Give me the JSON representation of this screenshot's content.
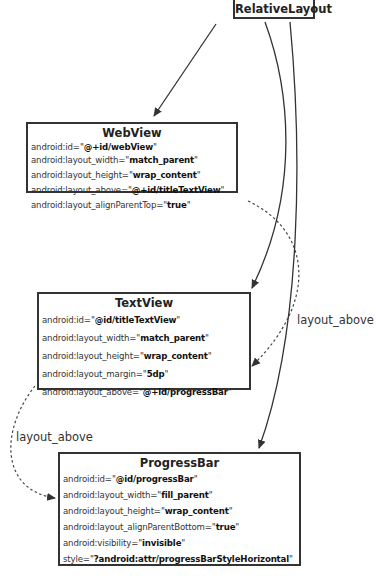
{
  "root": {
    "title": "RelativeLayout"
  },
  "nodes": [
    {
      "title": "WebView",
      "attrs": [
        {
          "key": "android:id=\"",
          "value": "@+id/webView",
          "end": "\""
        },
        {
          "key": "android:layout_width=\"",
          "value": "match_parent",
          "end": "\""
        },
        {
          "key": "android:layout_height=\"",
          "value": "wrap_content",
          "end": "\""
        },
        {
          "key": "android:layout_above=\"",
          "value": "@+id/titleTextView",
          "end": "\""
        },
        {
          "key": "android:layout_alignParentTop=\"",
          "value": "true",
          "end": "\""
        }
      ]
    },
    {
      "title": "TextView",
      "attrs": [
        {
          "key": "android:id=\"",
          "value": "@id/titleTextView",
          "end": "\""
        },
        {
          "key": "android:layout_width=\"",
          "value": "match_parent",
          "end": "\""
        },
        {
          "key": "android:layout_height=\"",
          "value": "wrap_content",
          "end": "\""
        },
        {
          "key": "android:layout_margin=\"",
          "value": "5dp",
          "end": "\""
        },
        {
          "key": "android:layout_above=\"",
          "value": "@+id/progressBar",
          "end": "\""
        }
      ]
    },
    {
      "title": "ProgressBar",
      "attrs": [
        {
          "key": "android:id=\"",
          "value": "@id/progressBar",
          "end": "\""
        },
        {
          "key": "android:layout_width=\"",
          "value": "fill_parent",
          "end": "\""
        },
        {
          "key": "android:layout_height=\"",
          "value": "wrap_content",
          "end": "\""
        },
        {
          "key": "android:layout_alignParentBottom=\"",
          "value": "true",
          "end": "\""
        },
        {
          "key": "android:visibility=\"",
          "value": "invisible",
          "end": "\""
        },
        {
          "key": "style=\"",
          "value": "?android:attr/progressBarStyleHorizontal",
          "end": "\""
        }
      ]
    }
  ],
  "edge_labels": {
    "webview_to_textview": "layout_above",
    "textview_to_progressbar": "layout_above"
  },
  "colors": {
    "line": "#333333",
    "box_border": "#333333",
    "background": "#ffffff"
  }
}
